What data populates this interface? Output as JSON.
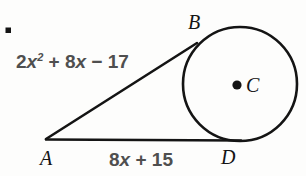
{
  "figure": {
    "type": "geometry-diagram",
    "background_color": "#fdfdfc",
    "stroke_color": "#141414",
    "label_color": "#141414",
    "measure_color": "#4f4f4f",
    "bullet": {
      "name": "problem-bullet",
      "x": 8,
      "y": 30,
      "size": 5
    },
    "circle": {
      "center_label": "C",
      "center_x": 240,
      "center_y": 84,
      "radius": 57,
      "center_dot_radius": 4.5
    },
    "points": [
      {
        "id": "A",
        "label": "A",
        "x": 46,
        "y": 139,
        "role": "external-vertex"
      },
      {
        "id": "B",
        "label": "B",
        "x": 196,
        "y": 44,
        "role": "tangent-point"
      },
      {
        "id": "C",
        "label": "C",
        "x": 240,
        "y": 84,
        "role": "circle-center"
      },
      {
        "id": "D",
        "label": "D",
        "x": 223,
        "y": 140,
        "role": "tangent-point"
      }
    ],
    "segments": [
      {
        "id": "AB",
        "from": "A",
        "to": "B",
        "measure": "2x² + 8x − 17",
        "measure_parts": {
          "coef": "2",
          "var": "x",
          "exp": "2",
          "rest": " + 8",
          "var2": "x",
          "tail": " − 17"
        }
      },
      {
        "id": "AD",
        "from": "A",
        "to": "D",
        "measure": "8x + 15",
        "measure_parts": {
          "coef": "8",
          "var": "x",
          "tail": " + 15"
        }
      }
    ],
    "labels": {
      "B": "B",
      "C": "C",
      "A": "A",
      "D": "D",
      "measure_ab_coef": "2",
      "measure_ab_var": "x",
      "measure_ab_exp": "2",
      "measure_ab_mid": " + 8",
      "measure_ab_var2": "x",
      "measure_ab_tail": " − 17",
      "measure_ad_coef": "8",
      "measure_ad_var": "x",
      "measure_ad_tail": " + 15"
    }
  }
}
